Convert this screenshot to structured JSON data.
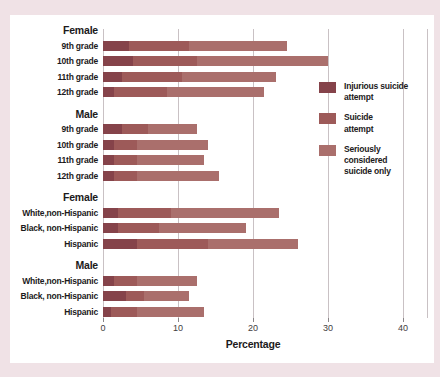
{
  "colors": {
    "background": "#f0e2e6",
    "panel": "#ffffff",
    "gridline": "#c9c1c4",
    "injurious": "#85434a",
    "attempt": "#9d5a59",
    "considered": "#aa6f6c"
  },
  "chart_data": {
    "type": "bar",
    "orientation": "horizontal-stacked",
    "xlabel": "Percentage",
    "xlim": [
      0,
      40
    ],
    "xticks": [
      0,
      10,
      20,
      30,
      40
    ],
    "grid": true,
    "legend_position": "right",
    "series_names": [
      "Injurious suicide attempt",
      "Suicide attempt",
      "Seriously considered suicide only"
    ],
    "groups": [
      {
        "header": "Female",
        "rows": [
          {
            "label": "9th grade",
            "values": [
              3.5,
              8.0,
              13.0
            ],
            "total": 24.5
          },
          {
            "label": "10th grade",
            "values": [
              4.0,
              8.5,
              17.5
            ],
            "total": 30.0
          },
          {
            "label": "11th grade",
            "values": [
              2.5,
              8.0,
              12.5
            ],
            "total": 23.0
          },
          {
            "label": "12th grade",
            "values": [
              1.5,
              7.0,
              13.0
            ],
            "total": 21.5
          }
        ]
      },
      {
        "header": "Male",
        "rows": [
          {
            "label": "9th grade",
            "values": [
              2.5,
              3.5,
              6.5
            ],
            "total": 12.5
          },
          {
            "label": "10th grade",
            "values": [
              1.5,
              3.0,
              9.5
            ],
            "total": 14.0
          },
          {
            "label": "11th grade",
            "values": [
              1.5,
              3.0,
              9.0
            ],
            "total": 13.5
          },
          {
            "label": "12th grade",
            "values": [
              1.5,
              3.0,
              11.0
            ],
            "total": 15.5
          }
        ]
      },
      {
        "header": "Female",
        "rows": [
          {
            "label": "White,non-Hispanic",
            "values": [
              2.0,
              7.0,
              14.5
            ],
            "total": 23.5
          },
          {
            "label": "Black, non-Hispanic",
            "values": [
              2.0,
              5.5,
              11.5
            ],
            "total": 19.0
          },
          {
            "label": "Hispanic",
            "values": [
              4.5,
              9.5,
              12.0
            ],
            "total": 26.0
          }
        ]
      },
      {
        "header": "Male",
        "rows": [
          {
            "label": "White,non-Hispanic",
            "values": [
              1.5,
              3.0,
              8.0
            ],
            "total": 12.5
          },
          {
            "label": "Black, non-Hispanic",
            "values": [
              3.0,
              2.5,
              6.0
            ],
            "total": 11.5
          },
          {
            "label": "Hispanic",
            "values": [
              1.0,
              3.5,
              9.0
            ],
            "total": 13.5
          }
        ]
      }
    ],
    "legend": {
      "items": [
        {
          "label": "Injurious suicide attempt",
          "lines": [
            "Injurious suicide",
            "attempt"
          ],
          "color": "#85434a"
        },
        {
          "label": "Suicide attempt",
          "lines": [
            "Suicide",
            "attempt"
          ],
          "color": "#9d5a59"
        },
        {
          "label": "Seriously considered suicide only",
          "lines": [
            "Seriously",
            "considered",
            "suicide only"
          ],
          "color": "#aa6f6c"
        }
      ]
    }
  }
}
